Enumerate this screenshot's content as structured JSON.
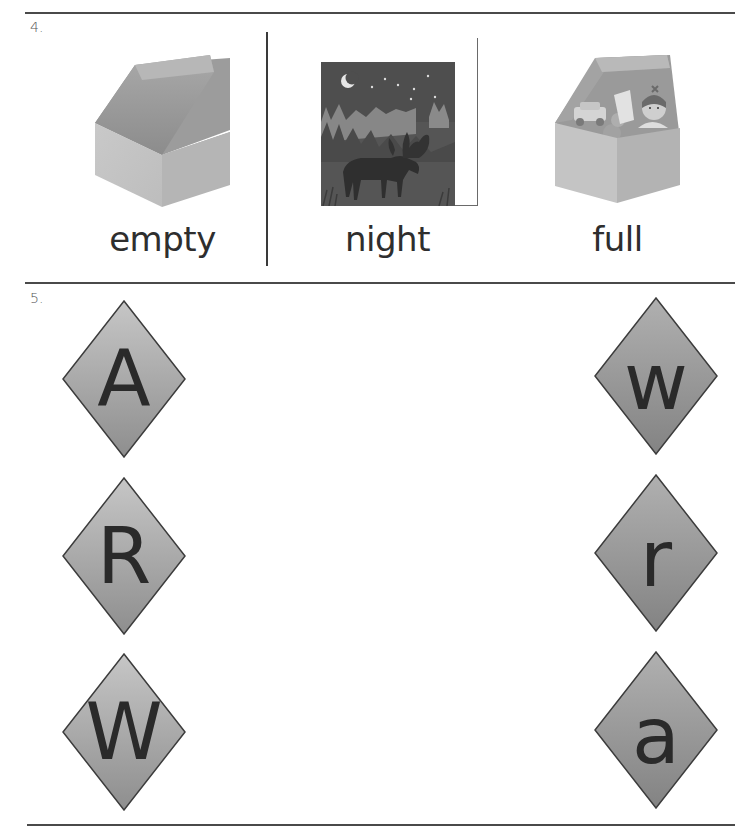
{
  "worksheet": {
    "exercise4": {
      "number": "4.",
      "items": [
        {
          "word": "empty",
          "picture": "empty-box-icon"
        },
        {
          "word": "night",
          "picture": "night-moose-scene"
        },
        {
          "word": "full",
          "picture": "toy-box-full-icon"
        }
      ]
    },
    "exercise5": {
      "number": "5.",
      "left_letters": [
        "A",
        "R",
        "W"
      ],
      "right_letters": [
        "w",
        "r",
        "a"
      ]
    },
    "colors": {
      "rule_line": "#4a4a4a",
      "diamond_light": "#c4c4c4",
      "diamond_dark": "#8a8a8a",
      "diamond_border": "#3c3c3c",
      "letter": "#2a2a2a"
    }
  }
}
